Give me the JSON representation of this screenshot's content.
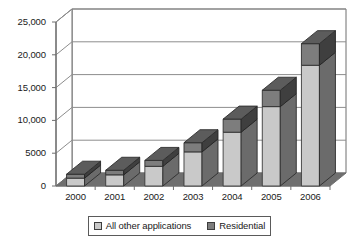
{
  "chart_data": {
    "type": "bar",
    "subtype": "stacked-column-3d",
    "title": "",
    "xlabel": "",
    "ylabel": "",
    "categories": [
      "2000",
      "2001",
      "2002",
      "2003",
      "2004",
      "2005",
      "2006"
    ],
    "series": [
      {
        "name": "All other applications",
        "color": "#c9c9c9",
        "values": [
          1200,
          1700,
          3000,
          5200,
          8200,
          12100,
          18400
        ]
      },
      {
        "name": "Residential",
        "color": "#7d7d7d",
        "values": [
          600,
          700,
          900,
          1400,
          2000,
          2500,
          3300
        ]
      }
    ],
    "totals": [
      1800,
      2400,
      3900,
      6600,
      10200,
      14600,
      21700
    ],
    "ylim": [
      0,
      25000
    ],
    "ytick_values": [
      0,
      5000,
      10000,
      15000,
      20000,
      25000
    ],
    "ytick_labels": [
      "0",
      "5000",
      "10,000",
      "15,000",
      "20,000",
      "25,000"
    ],
    "grid": true,
    "legend_position": "bottom"
  },
  "legend": {
    "entries": [
      {
        "label": "All other applications",
        "swatch_color": "#c9c9c9"
      },
      {
        "label": "Residential",
        "swatch_color": "#7d7d7d"
      }
    ]
  },
  "colors": {
    "plot_background": "#ffffff",
    "gridline": "#8d8d8d",
    "axis_line": "#6e6e6e",
    "floor": "#6f6f6f",
    "side_wall": "#d5d5d5",
    "series_light_front": "#c9c9c9",
    "series_light_side": "#6b6b6b",
    "series_light_top": "#9e9e9e",
    "series_dark_front": "#7d7d7d",
    "series_dark_side": "#3f3f3f",
    "series_dark_top": "#5c5c5c",
    "text": "#1a1a1a"
  }
}
